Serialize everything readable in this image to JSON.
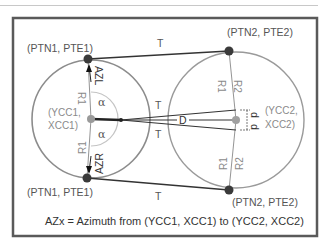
{
  "diagram": {
    "labels": {
      "ptn1_pte1_top": "(PTN1, PTE1)",
      "ptn1_pte1_bottom": "(PTN1, PTE1)",
      "ptn2_pte2_top": "(PTN2, PTE2)",
      "ptn2_pte2_bottom": "(PTN2, PTE2)",
      "ycc1": "(YCC1,",
      "xcc1": "XCC1)",
      "ycc2": "(YCC2,",
      "xcc2": "XCC2)",
      "tangent": "T",
      "distance": "D",
      "offset": "d",
      "radius1": "R1",
      "radius2": "R2",
      "alpha": "α",
      "azimuth_left": "AZL",
      "azimuth_right": "AZR"
    },
    "caption": "AZx = Azimuth from (YCC1, XCC1) to (YCC2, XCC2)",
    "colors": {
      "frame": "#5a5a5a",
      "circle": "#8c8c8c",
      "tangent_line": "#333333",
      "point": "#3a3a3a",
      "center_point": "#9a9a9a",
      "text": "#555555"
    }
  }
}
